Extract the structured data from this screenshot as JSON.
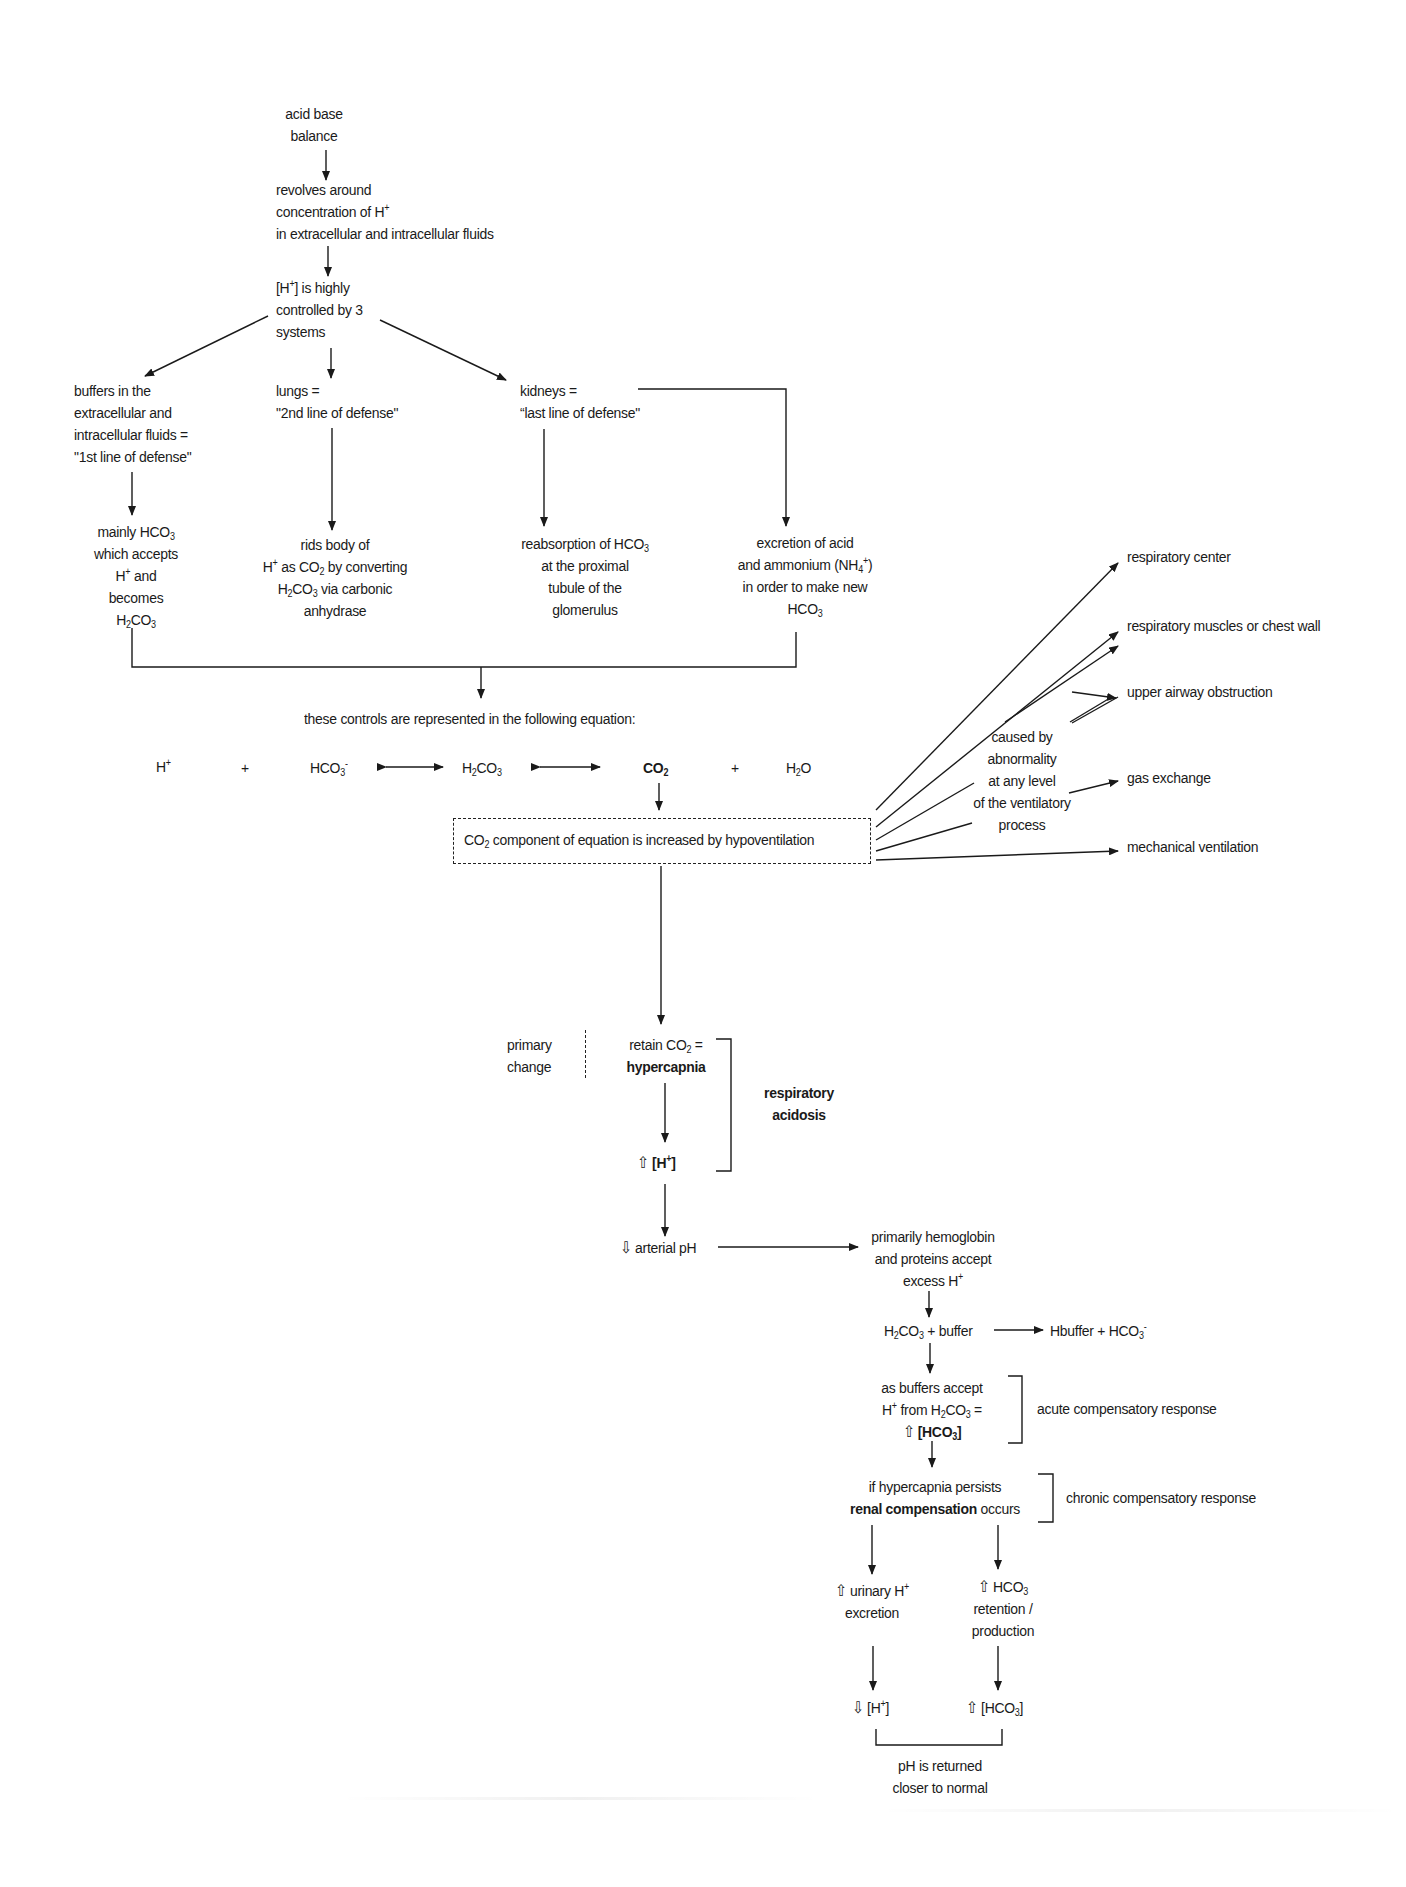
{
  "diagram": {
    "nodes": {
      "root": [
        "acid base",
        "balance"
      ],
      "revolves": [
        "revolves around",
        "concentration of H",
        "in extracellular and intracellular fluids"
      ],
      "controlled": [
        "[H",
        "] is highly",
        "controlled by 3",
        "systems"
      ],
      "buffers": [
        "buffers in the",
        "extracellular and",
        "intracellular fluids =",
        "\"1st line of defense\""
      ],
      "lungs": [
        "lungs =",
        "\"2nd line of defense\""
      ],
      "kidneys": [
        "kidneys =",
        "“last line of defense\""
      ],
      "buffers_detail": [
        "mainly HCO",
        "which accepts",
        "H",
        " and",
        "becomes",
        "H",
        "CO"
      ],
      "lungs_detail": [
        "rids body of",
        "H",
        " as CO",
        " by converting",
        "H",
        "CO",
        " via carbonic",
        "anhydrase"
      ],
      "kidneys_reabsorb": [
        "reabsorption of HCO",
        "at the proximal",
        "tubule of the",
        "glomerulus"
      ],
      "kidneys_excrete": [
        "excretion of acid",
        "and ammonium (NH",
        ")",
        "in order to make new",
        "HCO"
      ],
      "equation_intro": "these controls are represented in the following equation:",
      "equation": {
        "h": "H",
        "plus1": "+",
        "hco3": "HCO",
        "h2co3_a": "H",
        "h2co3_b": "CO",
        "co2": "CO",
        "plus2": "+",
        "h2o_a": "H",
        "h2o_b": "O"
      },
      "co2_box": [
        "CO",
        " component of equation is increased by hypoventilation"
      ],
      "caused_by": [
        "caused by",
        "abnormality",
        "at any level",
        "of the ventilatory",
        "process"
      ],
      "causes": [
        "respiratory center",
        "respiratory muscles or chest wall",
        "upper airway obstruction",
        "gas exchange",
        "mechanical ventilation"
      ],
      "primary_change": [
        "primary",
        "change"
      ],
      "retain": [
        "retain CO",
        " =",
        "hypercapnia"
      ],
      "up_h": [
        "⇧ ",
        "[H",
        "]"
      ],
      "respiratory_acidosis": [
        "respiratory",
        "acidosis"
      ],
      "arterial_ph": "⇩ arterial pH",
      "hemoglobin": [
        "primarily hemoglobin",
        "and proteins accept",
        "excess H"
      ],
      "h2co3_buffer": [
        "H",
        "CO",
        " + buffer"
      ],
      "hbuffer": [
        "Hbuffer + HCO"
      ],
      "as_buffers": [
        "as buffers accept",
        "H",
        " from H",
        "CO",
        " =",
        "⇧ ",
        "[HCO",
        "]"
      ],
      "acute": "acute compensatory response",
      "persists": [
        "if hypercapnia persists",
        "renal compensation",
        " occurs"
      ],
      "chronic": "chronic compensatory response",
      "urinary": [
        "⇧ urinary H",
        "excretion"
      ],
      "hco3_ret": [
        "⇧ HCO",
        "retention /",
        "production"
      ],
      "down_h": [
        "⇩ [H",
        "]"
      ],
      "up_hco3": [
        "⇧ [HCO",
        "]"
      ],
      "ph_returned": [
        "pH is returned",
        "closer to normal"
      ]
    },
    "sub_sup": {
      "plus": "+",
      "minus": "-",
      "two": "2",
      "three": "3",
      "four": "4"
    }
  }
}
